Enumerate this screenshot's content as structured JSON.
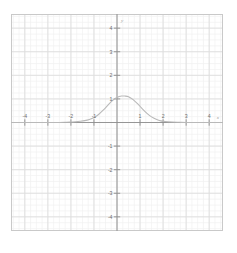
{
  "figure": {
    "title": "",
    "background_color": "#ffffff",
    "frame_color": "#c9c9c9",
    "major_grid_color": "#dedede",
    "minor_grid_color": "#f0f0f0",
    "axis_color": "#8d8d8d",
    "curve_color": "#b9b9b9",
    "tick_label_color": "#6e6e6e",
    "axis_label_color": "#9a9a9a"
  },
  "axes": {
    "x_axis_label": "x",
    "y_axis_label": "y",
    "x_ticks": [
      {
        "value": -4,
        "label": "-4"
      },
      {
        "value": -3,
        "label": "-3"
      },
      {
        "value": -2,
        "label": "-2"
      },
      {
        "value": -1,
        "label": "-1"
      },
      {
        "value": 1,
        "label": "1"
      },
      {
        "value": 2,
        "label": "2"
      },
      {
        "value": 3,
        "label": "3"
      },
      {
        "value": 4,
        "label": "4"
      }
    ],
    "y_ticks": [
      {
        "value": 4,
        "label": "4"
      },
      {
        "value": 3,
        "label": "3"
      },
      {
        "value": 2,
        "label": "2"
      },
      {
        "value": 1,
        "label": "1"
      },
      {
        "value": -1,
        "label": "-1"
      },
      {
        "value": -2,
        "label": "-2"
      },
      {
        "value": -3,
        "label": "-3"
      },
      {
        "value": -4,
        "label": "-4"
      }
    ]
  },
  "chart_data": {
    "type": "line",
    "title": "",
    "xlabel": "x",
    "ylabel": "y",
    "xlim": [
      -4.6,
      4.6
    ],
    "ylim": [
      -4.6,
      4.6
    ],
    "grid": true,
    "minor_grid": true,
    "major_grid_step": 1,
    "minor_grid_step": 0.25,
    "legend": false,
    "series": [
      {
        "name": "bell curve",
        "color": "#b9b9b9",
        "peak_x": 0.35,
        "peak_y": 1.12,
        "x": [
          -4.6,
          -4.0,
          -3.5,
          -3.0,
          -2.5,
          -2.2,
          -2.0,
          -1.8,
          -1.6,
          -1.4,
          -1.2,
          -1.0,
          -0.8,
          -0.6,
          -0.4,
          -0.2,
          0.0,
          0.2,
          0.35,
          0.5,
          0.7,
          0.9,
          1.1,
          1.3,
          1.5,
          1.7,
          1.9,
          2.1,
          2.4,
          2.7,
          3.0,
          3.5,
          4.0,
          4.6
        ],
        "y": [
          0.0,
          0.0,
          0.0,
          0.0,
          0.0,
          0.01,
          0.02,
          0.03,
          0.05,
          0.08,
          0.13,
          0.21,
          0.34,
          0.52,
          0.73,
          0.93,
          1.06,
          1.12,
          1.12,
          1.09,
          0.97,
          0.79,
          0.58,
          0.39,
          0.24,
          0.14,
          0.07,
          0.04,
          0.02,
          0.01,
          0.0,
          0.0,
          0.0,
          0.0
        ]
      }
    ]
  }
}
